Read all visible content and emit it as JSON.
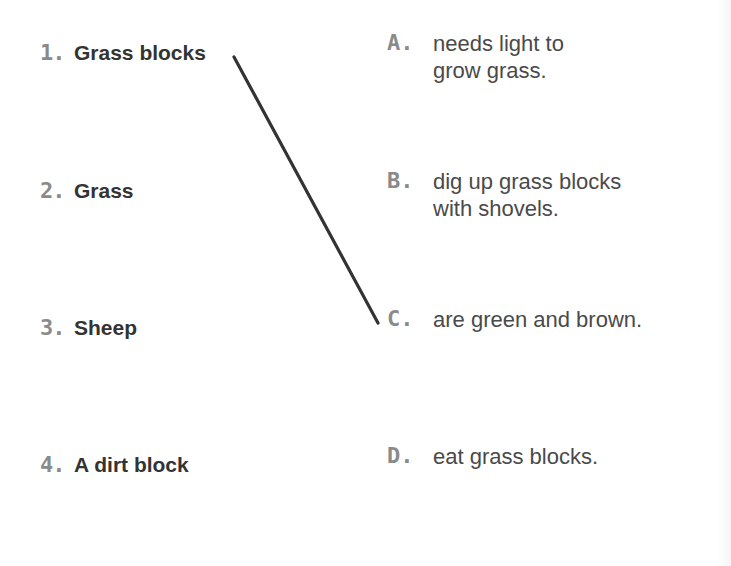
{
  "left_items": [
    {
      "number": "1.",
      "label": "Grass blocks"
    },
    {
      "number": "2.",
      "label": "Grass"
    },
    {
      "number": "3.",
      "label": "Sheep"
    },
    {
      "number": "4.",
      "label": "A dirt block"
    }
  ],
  "right_items": [
    {
      "letter": "A.",
      "text": "needs light to\ngrow grass."
    },
    {
      "letter": "B.",
      "text": "dig up grass blocks\nwith shovels."
    },
    {
      "letter": "C.",
      "text": "are green and brown."
    },
    {
      "letter": "D.",
      "text": "eat grass blocks."
    }
  ],
  "connections": [
    {
      "from": "1",
      "to": "C",
      "x1": 234,
      "y1": 57,
      "x2": 378,
      "y2": 323,
      "color": "#333333"
    }
  ]
}
